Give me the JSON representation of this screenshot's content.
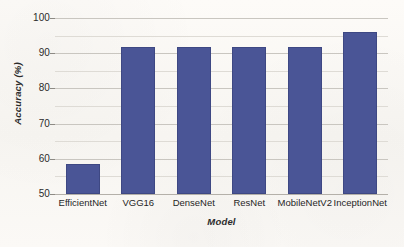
{
  "figure": {
    "background_color": "#faf8f5",
    "plot_background_color": "#fdfcfa"
  },
  "chart_data": {
    "type": "bar",
    "title": "",
    "categories": [
      "EfficientNet",
      "VGG16",
      "DenseNet",
      "ResNet",
      "MobileNetV2",
      "InceptionNet"
    ],
    "values": [
      58.5,
      91.8,
      91.8,
      91.8,
      91.8,
      96.0
    ],
    "xlabel": "Model",
    "ylabel": "Accuracy (%)",
    "ylim": [
      50,
      100
    ],
    "y_major_ticks": [
      50,
      60,
      70,
      80,
      90,
      100
    ],
    "y_tick_labels": [
      "50",
      "60",
      "70",
      "80",
      "90",
      "100"
    ],
    "y_minor_ticks": [
      55,
      65,
      75,
      85,
      95
    ],
    "grid": true,
    "grid_axis": "y",
    "legend": false,
    "bar_color": "#4a5596",
    "bar_edge_color": "#3e4883",
    "gridline_color": "#c9c6c0",
    "minor_gridline_color": "#dedbd5"
  }
}
